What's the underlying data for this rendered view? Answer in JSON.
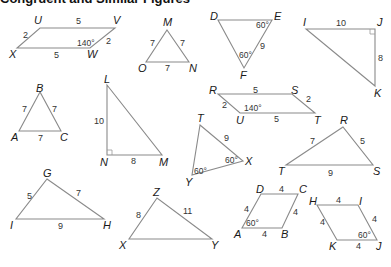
{
  "header": {
    "cutoff_text": "Congruent and Similar Figures"
  },
  "figures": [
    {
      "id": "UVWX",
      "type": "parallelogram",
      "vertices": [
        {
          "label": "U",
          "x": 40,
          "y": 28,
          "lx": 34,
          "ly": 24
        },
        {
          "label": "V",
          "x": 115,
          "y": 28,
          "lx": 113,
          "ly": 24
        },
        {
          "label": "W",
          "x": 90,
          "y": 48,
          "lx": 87,
          "ly": 58
        },
        {
          "label": "X",
          "x": 17,
          "y": 48,
          "lx": 9,
          "ly": 58
        }
      ],
      "sides": [
        {
          "label": "5",
          "x": 76,
          "y": 24
        },
        {
          "label": "2",
          "x": 106,
          "y": 44
        },
        {
          "label": "5",
          "x": 54,
          "y": 58
        },
        {
          "label": "2",
          "x": 23,
          "y": 38
        }
      ],
      "angles": [
        {
          "label": "140°",
          "x": 77,
          "y": 46
        }
      ]
    },
    {
      "id": "MNO",
      "type": "triangle",
      "vertices": [
        {
          "label": "M",
          "x": 167,
          "y": 30,
          "lx": 163,
          "ly": 26
        },
        {
          "label": "N",
          "x": 189,
          "y": 62,
          "lx": 189,
          "ly": 72
        },
        {
          "label": "O",
          "x": 146,
          "y": 62,
          "lx": 138,
          "ly": 72
        }
      ],
      "sides": [
        {
          "label": "7",
          "x": 150,
          "y": 46
        },
        {
          "label": "7",
          "x": 180,
          "y": 46
        },
        {
          "label": "7",
          "x": 165,
          "y": 71
        }
      ],
      "angles": []
    },
    {
      "id": "DEF",
      "type": "triangle",
      "vertices": [
        {
          "label": "D",
          "x": 218,
          "y": 20,
          "lx": 210,
          "ly": 20
        },
        {
          "label": "E",
          "x": 272,
          "y": 20,
          "lx": 274,
          "ly": 20
        },
        {
          "label": "F",
          "x": 244,
          "y": 68,
          "lx": 240,
          "ly": 79
        }
      ],
      "sides": [
        {
          "label": "9",
          "x": 260,
          "y": 49
        }
      ],
      "angles": [
        {
          "label": "60°",
          "x": 256,
          "y": 28
        },
        {
          "label": "60°",
          "x": 239,
          "y": 58
        }
      ]
    },
    {
      "id": "IJK",
      "type": "right-triangle",
      "vertices": [
        {
          "label": "I",
          "x": 306,
          "y": 29,
          "lx": 303,
          "ly": 26
        },
        {
          "label": "J",
          "x": 375,
          "y": 29,
          "lx": 377,
          "ly": 26
        },
        {
          "label": "K",
          "x": 375,
          "y": 86,
          "lx": 374,
          "ly": 97
        }
      ],
      "sides": [
        {
          "label": "10",
          "x": 336,
          "y": 26
        },
        {
          "label": "8",
          "x": 378,
          "y": 61
        }
      ],
      "angles": [],
      "right_angle": {
        "x": 375,
        "y": 29,
        "dx": -5,
        "dy": 5
      }
    },
    {
      "id": "ABC",
      "type": "triangle",
      "vertices": [
        {
          "label": "B",
          "x": 40,
          "y": 92,
          "lx": 36,
          "ly": 92
        },
        {
          "label": "A",
          "x": 19,
          "y": 131,
          "lx": 11,
          "ly": 141
        },
        {
          "label": "C",
          "x": 61,
          "y": 131,
          "lx": 60,
          "ly": 141
        }
      ],
      "sides": [
        {
          "label": "7",
          "x": 22,
          "y": 112
        },
        {
          "label": "7",
          "x": 52,
          "y": 112
        },
        {
          "label": "7",
          "x": 38,
          "y": 141
        }
      ],
      "angles": []
    },
    {
      "id": "LMN",
      "type": "right-triangle",
      "vertices": [
        {
          "label": "L",
          "x": 107,
          "y": 85,
          "lx": 104,
          "ly": 83
        },
        {
          "label": "M",
          "x": 162,
          "y": 155,
          "lx": 159,
          "ly": 166
        },
        {
          "label": "N",
          "x": 107,
          "y": 155,
          "lx": 100,
          "ly": 166
        }
      ],
      "sides": [
        {
          "label": "10",
          "x": 94,
          "y": 124
        },
        {
          "label": "8",
          "x": 131,
          "y": 164
        }
      ],
      "angles": [],
      "right_angle": {
        "x": 107,
        "y": 155,
        "dx": 5,
        "dy": -5
      }
    },
    {
      "id": "RSTU",
      "type": "parallelogram",
      "vertices": [
        {
          "label": "R",
          "x": 218,
          "y": 94,
          "lx": 209,
          "ly": 94
        },
        {
          "label": "S",
          "x": 292,
          "y": 94,
          "lx": 291,
          "ly": 94
        },
        {
          "label": "T",
          "x": 315,
          "y": 113,
          "lx": 314,
          "ly": 124
        },
        {
          "label": "U",
          "x": 240,
          "y": 113,
          "lx": 236,
          "ly": 124
        }
      ],
      "sides": [
        {
          "label": "5",
          "x": 253,
          "y": 93
        },
        {
          "label": "2",
          "x": 306,
          "y": 102
        },
        {
          "label": "5",
          "x": 274,
          "y": 122
        },
        {
          "label": "2",
          "x": 222,
          "y": 108
        }
      ],
      "angles": [
        {
          "label": "140°",
          "x": 244,
          "y": 111
        }
      ]
    },
    {
      "id": "TXY",
      "type": "triangle",
      "vertices": [
        {
          "label": "T",
          "x": 200,
          "y": 125,
          "lx": 197,
          "ly": 122
        },
        {
          "label": "X",
          "x": 243,
          "y": 161,
          "lx": 245,
          "ly": 165
        },
        {
          "label": "Y",
          "x": 192,
          "y": 175,
          "lx": 185,
          "ly": 186
        }
      ],
      "sides": [
        {
          "label": "9",
          "x": 224,
          "y": 141
        }
      ],
      "angles": [
        {
          "label": "60°",
          "x": 225,
          "y": 163
        },
        {
          "label": "60°",
          "x": 194,
          "y": 174
        }
      ]
    },
    {
      "id": "RST",
      "type": "triangle",
      "vertices": [
        {
          "label": "R",
          "x": 343,
          "y": 127,
          "lx": 340,
          "ly": 124
        },
        {
          "label": "T",
          "x": 286,
          "y": 165,
          "lx": 278,
          "ly": 175
        },
        {
          "label": "S",
          "x": 373,
          "y": 165,
          "lx": 373,
          "ly": 175
        }
      ],
      "sides": [
        {
          "label": "7",
          "x": 310,
          "y": 144
        },
        {
          "label": "5",
          "x": 360,
          "y": 144
        },
        {
          "label": "9",
          "x": 328,
          "y": 176
        }
      ],
      "angles": []
    },
    {
      "id": "GHI",
      "type": "triangle",
      "vertices": [
        {
          "label": "G",
          "x": 47,
          "y": 179,
          "lx": 43,
          "ly": 177
        },
        {
          "label": "H",
          "x": 104,
          "y": 219,
          "lx": 103,
          "ly": 229
        },
        {
          "label": "I",
          "x": 16,
          "y": 219,
          "lx": 10,
          "ly": 229
        }
      ],
      "sides": [
        {
          "label": "5",
          "x": 27,
          "y": 199
        },
        {
          "label": "7",
          "x": 76,
          "y": 196
        },
        {
          "label": "9",
          "x": 58,
          "y": 229
        }
      ],
      "angles": []
    },
    {
      "id": "XYZ",
      "type": "triangle",
      "vertices": [
        {
          "label": "Z",
          "x": 157,
          "y": 198,
          "lx": 153,
          "ly": 196
        },
        {
          "label": "X",
          "x": 129,
          "y": 239,
          "lx": 119,
          "ly": 249
        },
        {
          "label": "Y",
          "x": 212,
          "y": 239,
          "lx": 211,
          "ly": 249
        }
      ],
      "sides": [
        {
          "label": "8",
          "x": 136,
          "y": 218
        },
        {
          "label": "11",
          "x": 183,
          "y": 214
        }
      ],
      "angles": []
    },
    {
      "id": "ABCD",
      "type": "rhombus",
      "vertices": [
        {
          "label": "D",
          "x": 261,
          "y": 194,
          "lx": 256,
          "ly": 193
        },
        {
          "label": "C",
          "x": 298,
          "y": 194,
          "lx": 299,
          "ly": 193
        },
        {
          "label": "B",
          "x": 282,
          "y": 228,
          "lx": 281,
          "ly": 238
        },
        {
          "label": "A",
          "x": 242,
          "y": 228,
          "lx": 234,
          "ly": 238
        }
      ],
      "sides": [
        {
          "label": "4",
          "x": 279,
          "y": 192
        },
        {
          "label": "4",
          "x": 293,
          "y": 215
        },
        {
          "label": "4",
          "x": 262,
          "y": 237
        },
        {
          "label": "4",
          "x": 244,
          "y": 212
        }
      ],
      "angles": [
        {
          "label": "60°",
          "x": 246,
          "y": 226
        }
      ]
    },
    {
      "id": "HIJK",
      "type": "rhombus",
      "vertices": [
        {
          "label": "H",
          "x": 317,
          "y": 205,
          "lx": 309,
          "ly": 205
        },
        {
          "label": "I",
          "x": 358,
          "y": 205,
          "lx": 359,
          "ly": 205
        },
        {
          "label": "J",
          "x": 377,
          "y": 240,
          "lx": 376,
          "ly": 250
        },
        {
          "label": "K",
          "x": 337,
          "y": 240,
          "lx": 329,
          "ly": 250
        }
      ],
      "sides": [
        {
          "label": "4",
          "x": 336,
          "y": 203
        },
        {
          "label": "4",
          "x": 372,
          "y": 222
        },
        {
          "label": "4",
          "x": 356,
          "y": 249
        },
        {
          "label": "4",
          "x": 320,
          "y": 225
        }
      ],
      "angles": [
        {
          "label": "60°",
          "x": 358,
          "y": 238
        }
      ]
    }
  ]
}
